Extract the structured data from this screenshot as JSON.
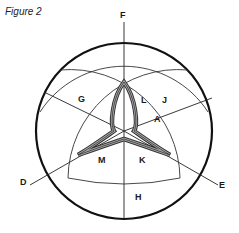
{
  "figure": {
    "title": "Figure 2",
    "labels": {
      "F": "F",
      "G": "G",
      "L": "L",
      "J": "J",
      "A": "A",
      "D": "D",
      "M": "M",
      "K": "K",
      "E": "E",
      "H": "H"
    }
  }
}
